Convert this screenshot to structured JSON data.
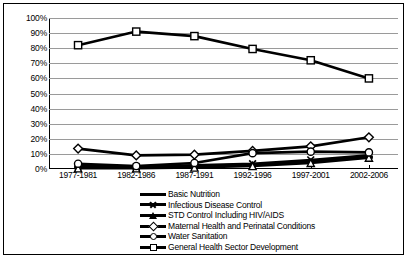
{
  "chart_data": {
    "type": "line",
    "title": "",
    "xlabel": "",
    "ylabel": "",
    "categories": [
      "1977-1981",
      "1982-1986",
      "1987-1991",
      "1992-1996",
      "1997-2001",
      "2002-2006"
    ],
    "ylim": [
      0,
      100
    ],
    "ytick_labels": [
      "100%",
      "90%",
      "80%",
      "70%",
      "60%",
      "50%",
      "40%",
      "30%",
      "20%",
      "10%",
      "0%"
    ],
    "ytick_values": [
      100,
      90,
      80,
      70,
      60,
      50,
      40,
      30,
      20,
      10,
      0
    ],
    "grid": true,
    "legend_position": "bottom",
    "series": [
      {
        "name": "Basic Nutrition",
        "marker": "dash",
        "values": [
          1.5,
          1.0,
          2.0,
          3.0,
          5.0,
          8.0
        ]
      },
      {
        "name": "Infectious Disease Control",
        "marker": "x",
        "values": [
          2.0,
          1.5,
          2.5,
          3.5,
          6.0,
          9.0
        ]
      },
      {
        "name": "STD Control Including HIV/AIDS",
        "marker": "triangle",
        "values": [
          0.5,
          0.5,
          1.0,
          2.0,
          4.0,
          7.5
        ]
      },
      {
        "name": "Maternal Health and Perinatal Conditions",
        "marker": "diamond",
        "values": [
          13.5,
          9.0,
          9.5,
          12.0,
          15.0,
          21.0
        ]
      },
      {
        "name": "Water Sanitation",
        "marker": "circle",
        "values": [
          3.5,
          2.0,
          4.0,
          10.5,
          11.5,
          11.0
        ]
      },
      {
        "name": "General Health Sector Development",
        "marker": "square",
        "values": [
          82.0,
          91.0,
          88.0,
          79.5,
          72.0,
          60.0
        ]
      }
    ],
    "colors": {
      "line": "#000000",
      "grid": "#9a9a9a",
      "axis": "#000000",
      "background": "#ffffff",
      "marker_fill": "#ffffff"
    }
  }
}
